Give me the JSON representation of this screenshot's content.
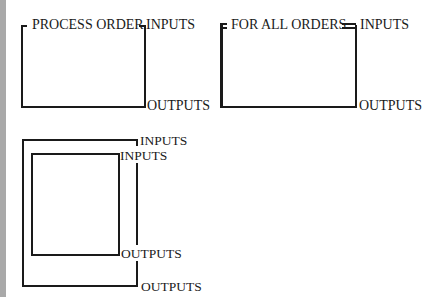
{
  "diagrams": [
    {
      "id": "process-order",
      "title": "PROCESS ORDER",
      "inputs_label": "INPUTS",
      "outputs_label": "OUTPUTS"
    },
    {
      "id": "for-all-orders",
      "title": "FOR ALL ORDERS",
      "inputs_label": "INPUTS",
      "outputs_label": "OUTPUTS"
    },
    {
      "id": "nested-blocks",
      "outer_inputs_label": "INPUTS",
      "inner_inputs_label": "INPUTS",
      "inner_outputs_label": "OUTPUTS",
      "outer_outputs_label": "OUTPUTS"
    }
  ],
  "colors": {
    "line": "#1a1a1a",
    "background": "#ffffff",
    "left_strip": "#a9a9a9"
  }
}
